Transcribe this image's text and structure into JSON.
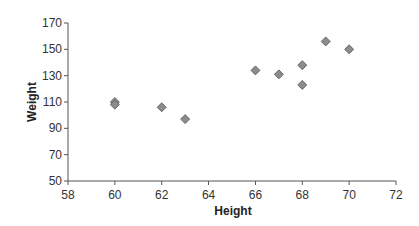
{
  "chart_data": {
    "type": "scatter",
    "title": "",
    "xlabel": "Height",
    "ylabel": "Weight",
    "xlim": [
      58,
      72
    ],
    "ylim": [
      50,
      170
    ],
    "xticks": [
      58,
      60,
      62,
      64,
      66,
      68,
      70,
      72
    ],
    "yticks": [
      50,
      70,
      90,
      110,
      130,
      150,
      170
    ],
    "grid": false,
    "legend": null,
    "marker": "diamond",
    "marker_color": "#8c8c8c",
    "series": [
      {
        "name": "Weight vs Height",
        "points": [
          {
            "x": 60,
            "y": 110
          },
          {
            "x": 60,
            "y": 108
          },
          {
            "x": 62,
            "y": 106
          },
          {
            "x": 63,
            "y": 97
          },
          {
            "x": 66,
            "y": 134
          },
          {
            "x": 67,
            "y": 131
          },
          {
            "x": 68,
            "y": 138
          },
          {
            "x": 68,
            "y": 123
          },
          {
            "x": 69,
            "y": 156
          },
          {
            "x": 70,
            "y": 150
          }
        ]
      }
    ]
  }
}
